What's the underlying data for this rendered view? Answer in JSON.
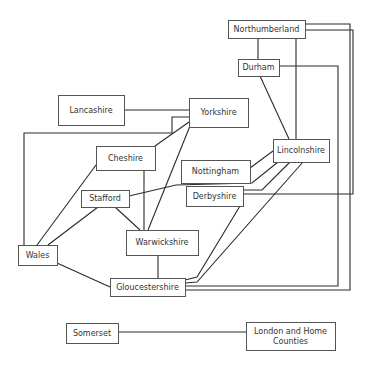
{
  "diagram": {
    "type": "network",
    "nodes": [
      {
        "id": "northumberland",
        "label": "Northumberland",
        "x": 228,
        "y": 20,
        "w": 77,
        "h": 18
      },
      {
        "id": "durham",
        "label": "Durham",
        "x": 238,
        "y": 59,
        "w": 41,
        "h": 17
      },
      {
        "id": "lancashire",
        "label": "Lancashire",
        "x": 58,
        "y": 95,
        "w": 66,
        "h": 30
      },
      {
        "id": "yorkshire",
        "label": "Yorkshire",
        "x": 189,
        "y": 98,
        "w": 59,
        "h": 29
      },
      {
        "id": "cheshire",
        "label": "Cheshire",
        "x": 96,
        "y": 146,
        "w": 59,
        "h": 24
      },
      {
        "id": "nottingham",
        "label": "Nottingham",
        "x": 181,
        "y": 160,
        "w": 69,
        "h": 23
      },
      {
        "id": "lincolnshire",
        "label": "Lincolnshire",
        "x": 273,
        "y": 139,
        "w": 56,
        "h": 23
      },
      {
        "id": "stafford",
        "label": "Stafford",
        "x": 81,
        "y": 190,
        "w": 48,
        "h": 17
      },
      {
        "id": "derbyshire",
        "label": "Derbyshire",
        "x": 186,
        "y": 186,
        "w": 57,
        "h": 20
      },
      {
        "id": "warwickshire",
        "label": "Warwickshire",
        "x": 126,
        "y": 230,
        "w": 72,
        "h": 25
      },
      {
        "id": "wales",
        "label": "Wales",
        "x": 18,
        "y": 245,
        "w": 39,
        "h": 20
      },
      {
        "id": "gloucestershire",
        "label": "Gloucestershire",
        "x": 110,
        "y": 278,
        "w": 75,
        "h": 18
      },
      {
        "id": "somerset",
        "label": "Somerset",
        "x": 66,
        "y": 323,
        "w": 52,
        "h": 20
      },
      {
        "id": "london",
        "label": "London and Home Counties",
        "label_lines": [
          "London and Home",
          "Counties"
        ],
        "x": 246,
        "y": 322,
        "w": 89,
        "h": 28
      }
    ],
    "edges": [
      {
        "from": "lancashire",
        "to": "yorkshire",
        "points": "124,110 189,110"
      },
      {
        "from": "yorkshire",
        "to": "wales",
        "points": "189,117 172,117 172,133 24,133 24,245"
      },
      {
        "from": "yorkshire",
        "to": "cheshire",
        "points": "189,122 155,146"
      },
      {
        "from": "yorkshire",
        "to": "warwickshire",
        "points": "190,126 148,230"
      },
      {
        "from": "cheshire",
        "to": "wales",
        "points": "96,165 37,245"
      },
      {
        "from": "cheshire",
        "to": "warwickshire",
        "points": "144,170 144,230"
      },
      {
        "from": "stafford",
        "to": "wales",
        "points": "98,207 48,245"
      },
      {
        "from": "stafford",
        "to": "warwickshire",
        "points": "115,207 140,230"
      },
      {
        "from": "stafford",
        "to": "lincolnshire",
        "points": "129,196 176,185 252,183 278,162"
      },
      {
        "from": "nottingham",
        "to": "lincolnshire",
        "points": "250,168 273,151"
      },
      {
        "from": "derbyshire",
        "to": "lincolnshire",
        "points": "243,190 262,190 290,162"
      },
      {
        "from": "derbyshire",
        "to": "gloucestershire",
        "points": "240,206 197,277 185,280"
      },
      {
        "from": "lincolnshire",
        "to": "gloucestershire",
        "points": "303,162 197,282 185,283"
      },
      {
        "from": "warwickshire",
        "to": "gloucestershire",
        "points": "158,255 158,278"
      },
      {
        "from": "wales",
        "to": "gloucestershire",
        "points": "57,263 110,287"
      },
      {
        "from": "northumberland",
        "to": "durham",
        "points": "258,38 258,59"
      },
      {
        "from": "northumberland",
        "to": "lincolnshire",
        "points": "296,38 296,139"
      },
      {
        "from": "durham",
        "to": "lincolnshire",
        "points": "260,76 289,139"
      },
      {
        "from": "northumberland",
        "to": "gloucestershire",
        "points": "305,24 350,24 350,290 185,290"
      },
      {
        "from": "northumberland",
        "to": "derbyshire",
        "points": "305,30 353,30 353,194 243,194"
      },
      {
        "from": "durham",
        "to": "gloucestershire",
        "points": "279,66 338,66 338,286 185,286"
      },
      {
        "from": "somerset",
        "to": "london",
        "points": "118,332 246,332"
      }
    ]
  }
}
